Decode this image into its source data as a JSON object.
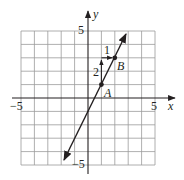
{
  "figure": {
    "type": "coordinate-plane-line",
    "axes": {
      "x_label": "x",
      "y_label": "y",
      "x_min_label": "−5",
      "x_max_label": "5",
      "y_min_label": "−5",
      "y_max_label": "5",
      "range": [
        -5,
        5
      ],
      "grid_step": 1
    },
    "line": {
      "from": [
        -2,
        -5
      ],
      "to": [
        3,
        5
      ],
      "arrows_both_ends": true
    },
    "points": [
      {
        "label": "A",
        "x": 1,
        "y": 1
      },
      {
        "label": "B",
        "x": 2,
        "y": 3
      }
    ],
    "slope_triangle": {
      "rise_label": "2",
      "run_label": "1",
      "rise_from": [
        1,
        1
      ],
      "rise_to": [
        1,
        3
      ],
      "run_from": [
        1,
        3
      ],
      "run_to": [
        2,
        3
      ]
    },
    "colors": {
      "ink": "#231f20",
      "grid": "#9a9a9a"
    }
  }
}
